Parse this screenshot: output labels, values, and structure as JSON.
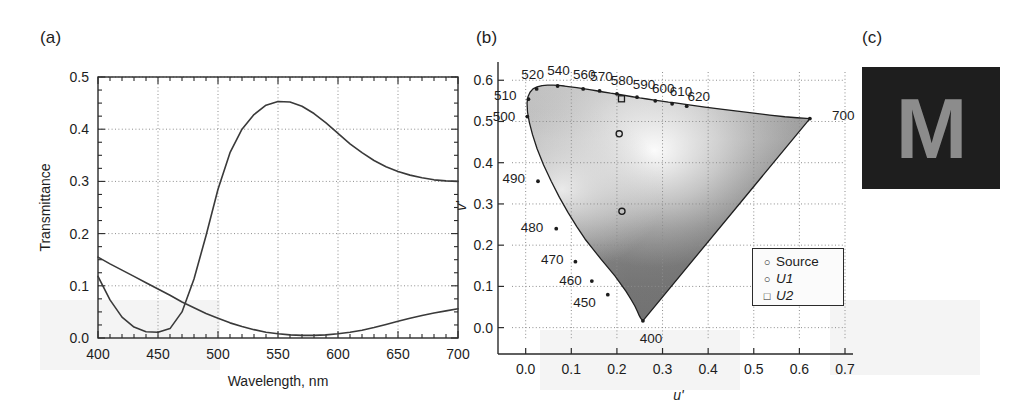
{
  "figure": {
    "width": 1030,
    "height": 405,
    "background": "#ffffff",
    "ink": "#1d1d1d"
  },
  "panels": [
    {
      "id": "a",
      "label": "(a)"
    },
    {
      "id": "b",
      "label": "(b)"
    },
    {
      "id": "c",
      "label": "(c)"
    }
  ],
  "chart_data": [
    {
      "panel": "(a)",
      "type": "line",
      "title": "",
      "xlabel": "Wavelength, nm",
      "ylabel": "Transmittance",
      "xlim": [
        400,
        700
      ],
      "ylim": [
        0.0,
        0.5
      ],
      "xticks": [
        400,
        450,
        500,
        550,
        600,
        650,
        700
      ],
      "xticklabels": [
        "400",
        "450",
        "500",
        "550",
        "600",
        "650",
        "700"
      ],
      "yticks": [
        0.0,
        0.1,
        0.2,
        0.3,
        0.4,
        0.5
      ],
      "yticklabels": [
        "0.0",
        "0.1",
        "0.2",
        "0.3",
        "0.4",
        "0.5"
      ],
      "minor_xtick_step": 10,
      "minor_ytick_step": 0.025,
      "grid": true,
      "grid_style": "dotted",
      "legend": null,
      "series": [
        {
          "name": "U1",
          "color": "#3a3a3a",
          "x": [
            400,
            410,
            420,
            430,
            440,
            450,
            460,
            470,
            480,
            490,
            500,
            510,
            520,
            530,
            540,
            550,
            560,
            570,
            580,
            590,
            600,
            610,
            620,
            630,
            640,
            650,
            660,
            670,
            680,
            690,
            700
          ],
          "y": [
            0.118,
            0.073,
            0.04,
            0.021,
            0.012,
            0.011,
            0.018,
            0.05,
            0.113,
            0.196,
            0.285,
            0.355,
            0.4,
            0.428,
            0.446,
            0.453,
            0.452,
            0.444,
            0.43,
            0.412,
            0.392,
            0.372,
            0.355,
            0.34,
            0.328,
            0.319,
            0.312,
            0.307,
            0.303,
            0.301,
            0.3
          ]
        },
        {
          "name": "U2",
          "color": "#3a3a3a",
          "x": [
            400,
            410,
            420,
            430,
            440,
            450,
            460,
            470,
            480,
            490,
            500,
            510,
            520,
            530,
            540,
            550,
            560,
            570,
            580,
            590,
            600,
            610,
            620,
            630,
            640,
            650,
            660,
            670,
            680,
            690,
            700
          ],
          "y": [
            0.155,
            0.142,
            0.13,
            0.118,
            0.106,
            0.094,
            0.082,
            0.069,
            0.058,
            0.047,
            0.038,
            0.029,
            0.022,
            0.016,
            0.011,
            0.008,
            0.006,
            0.005,
            0.005,
            0.006,
            0.008,
            0.011,
            0.015,
            0.02,
            0.026,
            0.032,
            0.038,
            0.043,
            0.048,
            0.052,
            0.056
          ]
        }
      ]
    },
    {
      "panel": "(b)",
      "type": "scatter",
      "subtype": "cie-1976-ucs-chromaticity-diagram",
      "title": "",
      "xlabel": "u'",
      "ylabel": "v'",
      "xlim": [
        -0.03,
        0.7
      ],
      "ylim": [
        -0.03,
        0.62
      ],
      "xticks": [
        0.0,
        0.1,
        0.2,
        0.3,
        0.4,
        0.5,
        0.6,
        0.7
      ],
      "xticklabels": [
        "0.0",
        "0.1",
        "0.2",
        "0.3",
        "0.4",
        "0.5",
        "0.6",
        "0.7"
      ],
      "yticks": [
        0.0,
        0.1,
        0.2,
        0.3,
        0.4,
        0.5,
        0.6
      ],
      "yticklabels": [
        "0.0",
        "0.1",
        "0.2",
        "0.3",
        "0.4",
        "0.5",
        "0.6"
      ],
      "grid": true,
      "grid_style": "dotted",
      "legend": {
        "position": "lower-right",
        "entries": [
          {
            "label": "Source",
            "marker": "circle",
            "italic": false
          },
          {
            "label": "U1",
            "marker": "circle",
            "italic": true
          },
          {
            "label": "U2",
            "marker": "square",
            "italic": true
          }
        ]
      },
      "locus_labels": [
        {
          "nm": "400",
          "u": 0.257,
          "v": 0.0165
        },
        {
          "nm": "450",
          "u": 0.18,
          "v": 0.08
        },
        {
          "nm": "460",
          "u": 0.145,
          "v": 0.113
        },
        {
          "nm": "470",
          "u": 0.109,
          "v": 0.16
        },
        {
          "nm": "480",
          "u": 0.067,
          "v": 0.24
        },
        {
          "nm": "490",
          "u": 0.027,
          "v": 0.355
        },
        {
          "nm": "500",
          "u": 0.0035,
          "v": 0.512
        },
        {
          "nm": "510",
          "u": 0.006,
          "v": 0.554
        },
        {
          "nm": "520",
          "u": 0.024,
          "v": 0.579
        },
        {
          "nm": "540",
          "u": 0.07,
          "v": 0.586
        },
        {
          "nm": "560",
          "u": 0.126,
          "v": 0.579
        },
        {
          "nm": "570",
          "u": 0.162,
          "v": 0.574
        },
        {
          "nm": "580",
          "u": 0.2,
          "v": 0.567
        },
        {
          "nm": "590",
          "u": 0.244,
          "v": 0.559
        },
        {
          "nm": "600",
          "u": 0.284,
          "v": 0.55
        },
        {
          "nm": "610",
          "u": 0.321,
          "v": 0.543
        },
        {
          "nm": "620",
          "u": 0.353,
          "v": 0.537
        },
        {
          "nm": "700",
          "u": 0.623,
          "v": 0.507
        }
      ],
      "points": [
        {
          "name": "Source",
          "u": 0.211,
          "v": 0.282,
          "marker": "circle"
        },
        {
          "name": "U1",
          "u": 0.205,
          "v": 0.47,
          "marker": "circle"
        },
        {
          "name": "U2",
          "u": 0.21,
          "v": 0.555,
          "marker": "square"
        }
      ]
    }
  ],
  "panel_c": {
    "label": "(c)",
    "glyph": "M",
    "background_color": "#1e1e1e",
    "glyph_color": "#8c8c8c"
  }
}
